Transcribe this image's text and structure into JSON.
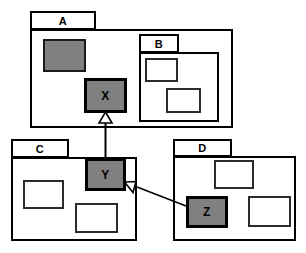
{
  "diagram": {
    "type": "uml-package-diagram",
    "colors": {
      "shaded_fill": "#808080",
      "node_fill": "#808080",
      "outline": "#000000",
      "background": "#ffffff"
    },
    "packages": [
      {
        "id": "A",
        "label": "A",
        "tab": {
          "x": 30,
          "y": 11,
          "w": 66,
          "h": 19
        },
        "body": {
          "x": 30,
          "y": 29,
          "w": 203,
          "h": 99
        },
        "inner_boxes": [
          {
            "x": 43,
            "y": 39,
            "w": 43,
            "h": 33,
            "fill": "shaded"
          }
        ]
      },
      {
        "id": "B",
        "label": "B",
        "tab": {
          "x": 139,
          "y": 34,
          "w": 40,
          "h": 19
        },
        "body": {
          "x": 139,
          "y": 52,
          "w": 80,
          "h": 70
        },
        "inner_boxes": [
          {
            "x": 145,
            "y": 58,
            "w": 33,
            "h": 24,
            "fill": "white"
          },
          {
            "x": 166,
            "y": 88,
            "w": 35,
            "h": 25,
            "fill": "white"
          }
        ]
      },
      {
        "id": "C",
        "label": "C",
        "tab": {
          "x": 11,
          "y": 139,
          "w": 58,
          "h": 19
        },
        "body": {
          "x": 11,
          "y": 157,
          "w": 126,
          "h": 84
        },
        "inner_boxes": [
          {
            "x": 23,
            "y": 180,
            "w": 41,
            "h": 29,
            "fill": "white"
          },
          {
            "x": 75,
            "y": 203,
            "w": 43,
            "h": 30,
            "fill": "white"
          }
        ]
      },
      {
        "id": "D",
        "label": "D",
        "tab": {
          "x": 173,
          "y": 139,
          "w": 59,
          "h": 18
        },
        "body": {
          "x": 173,
          "y": 156,
          "w": 123,
          "h": 85
        },
        "inner_boxes": [
          {
            "x": 214,
            "y": 160,
            "w": 40,
            "h": 29,
            "fill": "white"
          },
          {
            "x": 248,
            "y": 196,
            "w": 43,
            "h": 31,
            "fill": "white"
          }
        ]
      }
    ],
    "nodes": [
      {
        "id": "X",
        "label": "X",
        "x": 84,
        "y": 78,
        "w": 43,
        "h": 35,
        "parent": "A"
      },
      {
        "id": "Y",
        "label": "Y",
        "x": 85,
        "y": 158,
        "w": 41,
        "h": 33,
        "parent": "C"
      },
      {
        "id": "Z",
        "label": "Z",
        "x": 186,
        "y": 196,
        "w": 42,
        "h": 32,
        "parent": "D"
      }
    ],
    "edges": [
      {
        "from": "Y",
        "to": "X",
        "kind": "generalization",
        "arrowhead": "hollow-triangle",
        "path": "M 105.5 158 L 105.5 122"
      },
      {
        "from": "Z",
        "to": "Y",
        "kind": "generalization",
        "arrowhead": "hollow-triangle",
        "path": "M 186 206 L 135 186"
      }
    ]
  }
}
